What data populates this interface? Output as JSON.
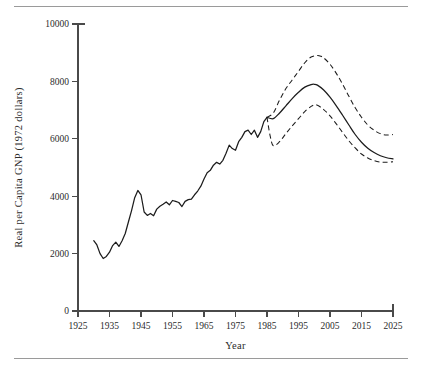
{
  "figure": {
    "top_rule": "horizontal-rule",
    "bottom_rule": "horizontal-rule"
  },
  "chart_data": {
    "type": "line",
    "title": "",
    "xlabel": "Year",
    "ylabel": "Real per Capita GNP (1972 dollars)",
    "xlim": [
      1925,
      2025
    ],
    "ylim": [
      0,
      10000
    ],
    "xticks": [
      1925,
      1935,
      1945,
      1955,
      1965,
      1975,
      1985,
      1995,
      2005,
      2015,
      2025
    ],
    "yticks": [
      0,
      2000,
      4000,
      6000,
      8000,
      10000
    ],
    "xtick_labels": [
      "1925",
      "1935",
      "1945",
      "1955",
      "1965",
      "1975",
      "1985",
      "1995",
      "2005",
      "2015",
      "2025"
    ],
    "ytick_labels": [
      "0",
      "2000",
      "4000",
      "6000",
      "8000",
      "10000"
    ],
    "grid": false,
    "legend": null,
    "legend_position": "none",
    "line_color": "#1c1c1c",
    "series": [
      {
        "name": "Historical real per capita GNP",
        "style": "solid",
        "x": [
          1930,
          1931,
          1932,
          1933,
          1934,
          1935,
          1936,
          1937,
          1938,
          1939,
          1940,
          1941,
          1942,
          1943,
          1944,
          1945,
          1946,
          1947,
          1948,
          1949,
          1950,
          1951,
          1952,
          1953,
          1954,
          1955,
          1956,
          1957,
          1958,
          1959,
          1960,
          1961,
          1962,
          1963,
          1964,
          1965,
          1966,
          1967,
          1968,
          1969,
          1970,
          1971,
          1972,
          1973,
          1974,
          1975,
          1976,
          1977,
          1978,
          1979,
          1980,
          1981,
          1982,
          1983,
          1984,
          1985
        ],
        "y": [
          2450,
          2300,
          2000,
          1830,
          1900,
          2050,
          2280,
          2400,
          2250,
          2450,
          2700,
          3100,
          3500,
          3950,
          4200,
          4050,
          3450,
          3330,
          3400,
          3320,
          3550,
          3650,
          3720,
          3800,
          3700,
          3850,
          3820,
          3780,
          3640,
          3820,
          3880,
          3900,
          4050,
          4180,
          4350,
          4600,
          4820,
          4900,
          5080,
          5180,
          5120,
          5250,
          5500,
          5780,
          5660,
          5600,
          5900,
          6050,
          6250,
          6300,
          6150,
          6300,
          6050,
          6250,
          6600,
          6750
        ]
      },
      {
        "name": "Projected median",
        "style": "solid",
        "x": [
          1985,
          1987,
          1989,
          1991,
          1993,
          1995,
          1997,
          1999,
          2000,
          2001,
          2003,
          2005,
          2007,
          2009,
          2011,
          2013,
          2015,
          2017,
          2019,
          2021,
          2023,
          2025
        ],
        "y": [
          6750,
          6700,
          6900,
          7150,
          7400,
          7620,
          7800,
          7890,
          7900,
          7870,
          7700,
          7450,
          7150,
          6820,
          6480,
          6150,
          5880,
          5670,
          5520,
          5410,
          5340,
          5300
        ]
      },
      {
        "name": "Upper projection bound",
        "style": "dashed",
        "x": [
          1985,
          1987,
          1989,
          1991,
          1993,
          1995,
          1997,
          1999,
          2001,
          2002,
          2003,
          2005,
          2007,
          2009,
          2011,
          2013,
          2015,
          2017,
          2019,
          2021,
          2023,
          2025
        ],
        "y": [
          6750,
          6900,
          7350,
          7750,
          8050,
          8350,
          8650,
          8850,
          8900,
          8880,
          8820,
          8600,
          8280,
          7900,
          7480,
          7080,
          6750,
          6480,
          6300,
          6180,
          6130,
          6150
        ]
      },
      {
        "name": "Lower projection bound",
        "style": "dashed",
        "x": [
          1985,
          1986,
          1987,
          1989,
          1991,
          1993,
          1995,
          1997,
          1999,
          2000,
          2001,
          2003,
          2005,
          2007,
          2009,
          2011,
          2013,
          2015,
          2017,
          2019,
          2021,
          2023,
          2025
        ],
        "y": [
          6750,
          6100,
          5760,
          5900,
          6180,
          6450,
          6700,
          6950,
          7130,
          7180,
          7170,
          7020,
          6800,
          6520,
          6220,
          5930,
          5680,
          5470,
          5330,
          5240,
          5190,
          5180,
          5200
        ]
      }
    ]
  }
}
